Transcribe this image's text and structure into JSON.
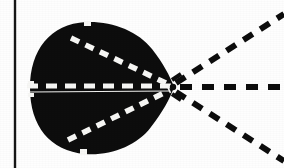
{
  "figure": {
    "canvas": {
      "width": 284,
      "height": 168
    },
    "background_color": "#fefefe",
    "ink_color": "#0d0d0d",
    "highlight_color": "#f7f7f5"
  },
  "axis_line": {
    "label": "vertical-reference-axis",
    "color": "#161616",
    "x": 15,
    "y_top": 0,
    "y_bottom": 168,
    "thickness": 2.4
  },
  "lobe": {
    "label": "main-lobe-blob",
    "fill_color": "#0d0d0d",
    "center_x": 98,
    "center_y": 88,
    "radius_x": 70,
    "radius_y": 66,
    "apex_x": 174,
    "apex_y": 87,
    "outline_path": "M 30 88 C 30 50 50 24 86 22 C 112 21 138 31 152 49 C 163 63 170 76 174 87 C 170 99 162 113 151 127 C 137 146 110 156 85 154 C 50 151 30 126 30 88 Z"
  },
  "interior_dashes": [
    {
      "label": "upper-interior-dash",
      "color": "#f7f7f5",
      "x1": 71,
      "y1": 38,
      "x2": 170,
      "y2": 85,
      "dash": "9 7",
      "width": 5.5
    },
    {
      "label": "center-interior-dash",
      "color": "#f7f7f5",
      "x1": 27,
      "y1": 86,
      "x2": 171,
      "y2": 86,
      "dash": "11 8",
      "width": 5
    },
    {
      "label": "lower-interior-dash",
      "color": "#f7f7f5",
      "x1": 68,
      "y1": 140,
      "x2": 170,
      "y2": 90,
      "dash": "9 7",
      "width": 5.5
    },
    {
      "label": "center-hairline-split",
      "color": "#f2f2f0",
      "x1": 29,
      "y1": 92,
      "x2": 170,
      "y2": 91,
      "dash": "none",
      "width": 1.2
    }
  ],
  "radiating_rays": [
    {
      "label": "upper-ray",
      "color": "#0d0d0d",
      "x1": 176,
      "y1": 83,
      "x2": 284,
      "y2": 14,
      "dash": "11 9",
      "width": 6
    },
    {
      "label": "center-ray",
      "color": "#0d0d0d",
      "x1": 180,
      "y1": 87,
      "x2": 284,
      "y2": 87,
      "dash": "12 10",
      "width": 6
    },
    {
      "label": "lower-ray",
      "color": "#0d0d0d",
      "x1": 176,
      "y1": 92,
      "x2": 284,
      "y2": 161,
      "dash": "11 9",
      "width": 6
    }
  ],
  "apex_marks": [
    {
      "label": "apex-spark-upper",
      "x1": 172,
      "y1": 80,
      "x2": 181,
      "y2": 74,
      "width": 4,
      "color": "#0d0d0d"
    },
    {
      "label": "apex-spark-lower",
      "x1": 172,
      "y1": 94,
      "x2": 181,
      "y2": 100,
      "width": 4,
      "color": "#0d0d0d"
    },
    {
      "label": "apex-node",
      "cx": 173,
      "cy": 87,
      "r": 3.2,
      "color": "#0d0d0d"
    }
  ],
  "edge_notches": [
    {
      "label": "notch-top",
      "x": 84,
      "y": 21,
      "w": 7,
      "h": 5
    },
    {
      "label": "notch-bottom",
      "x": 80,
      "y": 149,
      "w": 7,
      "h": 6
    },
    {
      "label": "notch-left-upper",
      "x": 28,
      "y": 81,
      "w": 6,
      "h": 5
    },
    {
      "label": "notch-left-lower",
      "x": 28,
      "y": 93,
      "w": 6,
      "h": 4
    }
  ]
}
